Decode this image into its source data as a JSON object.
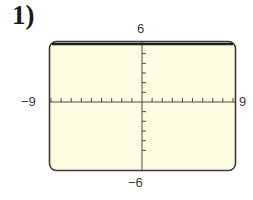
{
  "problem": {
    "number_label": "1)"
  },
  "labels": {
    "ymax": "6",
    "ymin": "−6",
    "xmin": "−9",
    "xmax": "9"
  },
  "colors": {
    "screen_background": "#fdfce0",
    "frame": "#3a3a3a",
    "graph_line": "#1e1e1e",
    "axis": "#4a4a4a"
  },
  "chart_data": {
    "type": "line",
    "title": "",
    "xlabel": "",
    "ylabel": "",
    "xlim": [
      -9,
      9
    ],
    "ylim": [
      -6,
      6
    ],
    "x_ticks_step": 1,
    "y_ticks_step": 1,
    "grid": false,
    "tick_labels": {
      "x": [
        "-9",
        "9"
      ],
      "y": [
        "-6",
        "6"
      ]
    },
    "series": [
      {
        "name": "y = 6",
        "equation": "y = 6",
        "x": [
          -9,
          9
        ],
        "y": [
          6,
          6
        ]
      }
    ],
    "legend": null,
    "style": "graphing-calculator window"
  }
}
